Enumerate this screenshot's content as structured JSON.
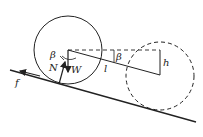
{
  "diagram": {
    "labels": {
      "beta_left": "β",
      "beta_right": "β",
      "normal": "N",
      "weight": "W",
      "friction": "f",
      "length": "l",
      "height": "h"
    },
    "elements": {
      "solid_circle": {
        "cx": 68,
        "cy": 50,
        "r": 34
      },
      "dashed_circle": {
        "cx": 160,
        "cy": 76,
        "r": 34
      },
      "incline": {
        "x1": 10,
        "y1": 70,
        "x2": 196,
        "y2": 122
      }
    },
    "colors": {
      "stroke": "#222222",
      "background": "#ffffff"
    }
  }
}
